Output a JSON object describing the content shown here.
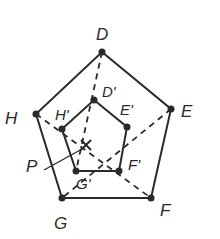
{
  "diagram": {
    "title": "",
    "colors": {
      "stroke": "#2a2a2a",
      "background": "#ffffff"
    },
    "outer_pentagon": {
      "vertices": [
        {
          "name": "D",
          "x": 102,
          "y": 52
        },
        {
          "name": "E",
          "x": 171,
          "y": 109
        },
        {
          "name": "F",
          "x": 151,
          "y": 198
        },
        {
          "name": "G",
          "x": 62,
          "y": 198
        },
        {
          "name": "H",
          "x": 36,
          "y": 114
        }
      ]
    },
    "inner_pentagon": {
      "vertices": [
        {
          "name": "D'",
          "x": 94,
          "y": 100
        },
        {
          "name": "E'",
          "x": 127,
          "y": 127
        },
        {
          "name": "F'",
          "x": 119,
          "y": 171
        },
        {
          "name": "G'",
          "x": 76,
          "y": 171
        },
        {
          "name": "H'",
          "x": 62,
          "y": 129
        }
      ]
    },
    "center": {
      "name": "P",
      "x": 86,
      "y": 145,
      "marker": "x"
    },
    "dashed_lines": [
      {
        "from": "D",
        "to": "G'"
      },
      {
        "from": "E",
        "to": "G"
      },
      {
        "from": "H",
        "to": "F"
      }
    ],
    "labels": {
      "D": "D",
      "E": "E",
      "F": "F",
      "G": "G",
      "H": "H",
      "D_prime": "D'",
      "E_prime": "E'",
      "F_prime": "F'",
      "G_prime": "G'",
      "H_prime": "H'",
      "P": "P"
    }
  }
}
